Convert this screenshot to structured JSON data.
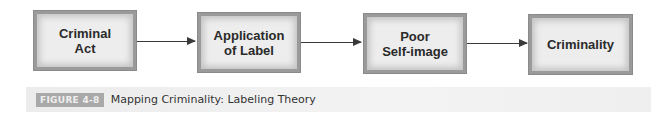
{
  "diagram": {
    "type": "flowchart",
    "direction": "left-to-right",
    "nodes": [
      {
        "id": "criminal-act",
        "label_line1": "Criminal",
        "label_line2": "Act"
      },
      {
        "id": "application-of-label",
        "label_line1": "Application",
        "label_line2": "of Label"
      },
      {
        "id": "poor-self-image",
        "label_line1": "Poor",
        "label_line2": "Self-image"
      },
      {
        "id": "criminality",
        "label_line1": "Criminality",
        "label_line2": ""
      }
    ],
    "edges": [
      {
        "from": "criminal-act",
        "to": "application-of-label"
      },
      {
        "from": "application-of-label",
        "to": "poor-self-image"
      },
      {
        "from": "poor-self-image",
        "to": "criminality"
      }
    ]
  },
  "caption": {
    "badge": "FIGURE 4-8",
    "title": "Mapping Criminality: Labeling Theory"
  },
  "colors": {
    "box_fill": "#ededed",
    "box_border": "#8a8a8a",
    "arrow": "#3a3a3a",
    "badge_bg": "#a9a9a9",
    "caption_bg": "#efefef"
  }
}
